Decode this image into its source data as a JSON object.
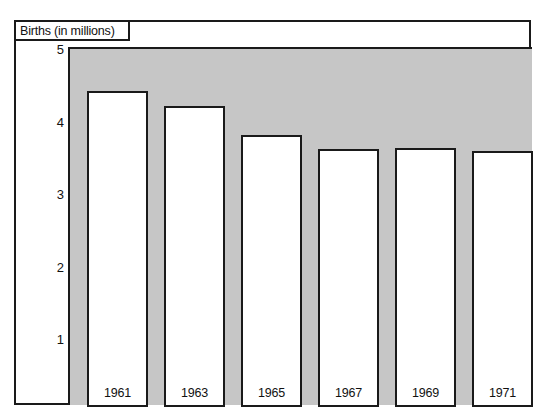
{
  "figure": {
    "title": "Births (in millions)"
  },
  "chart_data": {
    "type": "bar",
    "title": "Births (in millions)",
    "xlabel": "",
    "ylabel": "Births (in millions)",
    "categories": [
      "1961",
      "1963",
      "1965",
      "1967",
      "1969",
      "1971"
    ],
    "values": [
      4.35,
      4.15,
      3.75,
      3.55,
      3.57,
      3.53
    ],
    "yticks": [
      "1",
      "2",
      "3",
      "4",
      "5"
    ],
    "ytick_values": [
      1,
      2,
      3,
      4,
      5
    ],
    "ylim": [
      0,
      5.0
    ],
    "grid": false,
    "legend": false,
    "plot_background": "#c6c6c6",
    "bar_fill": "#ffffff",
    "bar_outline": "#1a1a1a",
    "bar_label_position": "inside-bottom"
  }
}
